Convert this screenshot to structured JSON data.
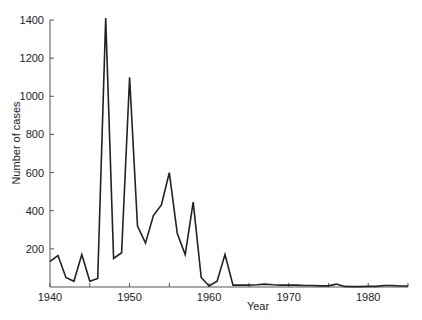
{
  "chart_data": {
    "type": "line",
    "title": "",
    "xlabel": "Year",
    "ylabel": "Number of cases",
    "xlim": [
      1940,
      1985
    ],
    "ylim": [
      0,
      1400
    ],
    "grid": false,
    "legend": null,
    "x_ticks": [
      1940,
      1945,
      1950,
      1955,
      1960,
      1965,
      1970,
      1975,
      1980,
      1985
    ],
    "x_tick_labels": [
      "1940",
      "",
      "1950",
      "",
      "1960",
      "",
      "1970",
      "",
      "1980",
      ""
    ],
    "y_ticks": [
      200,
      400,
      600,
      800,
      1000,
      1200,
      1400
    ],
    "y_tick_labels": [
      "200",
      "400",
      "600",
      "800",
      "1000",
      "1200",
      "1400"
    ],
    "line_color": "#222222",
    "series": [
      {
        "name": "Cases",
        "x": [
          1940,
          1941,
          1942,
          1943,
          1944,
          1945,
          1946,
          1947,
          1948,
          1949,
          1950,
          1951,
          1952,
          1953,
          1954,
          1955,
          1956,
          1957,
          1958,
          1959,
          1960,
          1961,
          1962,
          1963,
          1964,
          1965,
          1966,
          1967,
          1968,
          1969,
          1970,
          1971,
          1972,
          1973,
          1974,
          1975,
          1976,
          1977,
          1978,
          1979,
          1980,
          1981,
          1982,
          1983,
          1984,
          1985
        ],
        "values": [
          135,
          165,
          50,
          30,
          170,
          30,
          45,
          1410,
          150,
          180,
          1100,
          320,
          230,
          375,
          430,
          600,
          280,
          170,
          445,
          50,
          5,
          30,
          170,
          10,
          10,
          10,
          12,
          15,
          12,
          10,
          10,
          10,
          8,
          8,
          6,
          6,
          15,
          3,
          2,
          2,
          3,
          3,
          8,
          8,
          5,
          5
        ]
      }
    ]
  }
}
